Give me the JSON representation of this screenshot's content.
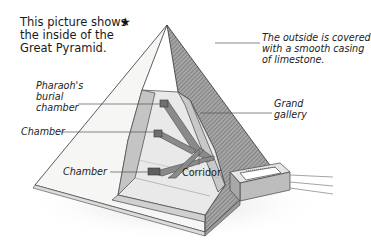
{
  "title": {
    "lines": [
      "This picture shows",
      "the inside of the",
      "Great Pyramid."
    ],
    "marker": "★"
  },
  "labels": {
    "outside_casing": [
      "The outside is covered",
      "with a smooth casing",
      "of limestone."
    ],
    "burial_chamber": [
      "Pharaoh's",
      "burial",
      "chamber"
    ],
    "grand_gallery": [
      "Grand",
      "gallery"
    ],
    "chamber_middle": "Chamber",
    "chamber_lower": "Chamber",
    "corridor": "Corridor"
  },
  "colors": {
    "outline": "#333333",
    "hatch_face": "#8a8a8a",
    "cut_stone": "#c9c9c9",
    "floor": "#eeeeee",
    "passage": "#7a7a7a",
    "leader_line": "#555555"
  }
}
